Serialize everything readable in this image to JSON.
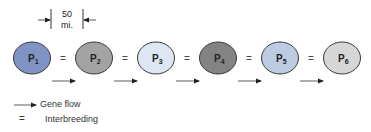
{
  "scale": {
    "value": "50",
    "unit": "mi."
  },
  "populations": [
    {
      "label": "P",
      "sub": "1",
      "fill": "#7f93c4",
      "cx": 32
    },
    {
      "label": "P",
      "sub": "2",
      "fill": "#a3a3a3",
      "cx": 94
    },
    {
      "label": "P",
      "sub": "3",
      "fill": "#dde6f2",
      "cx": 156
    },
    {
      "label": "P",
      "sub": "4",
      "fill": "#838383",
      "cx": 218
    },
    {
      "label": "P",
      "sub": "5",
      "fill": "#bccae2",
      "cx": 280
    },
    {
      "label": "P",
      "sub": "6",
      "fill": "#d6d6d6",
      "cx": 342
    }
  ],
  "connectors": {
    "interbreeding_symbol": "=",
    "positions": [
      63,
      125,
      187,
      249,
      311
    ]
  },
  "legend": {
    "gene_flow_label": "Gene flow",
    "interbreeding_symbol": "=",
    "interbreeding_label": "Interbreeding"
  }
}
